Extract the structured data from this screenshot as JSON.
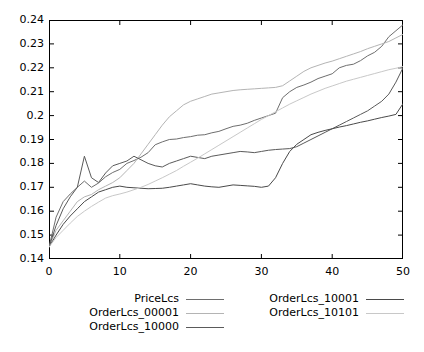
{
  "chart_data": {
    "type": "line",
    "title": "",
    "xlabel": "",
    "ylabel": "",
    "xlim": [
      0,
      50
    ],
    "ylim": [
      0.14,
      0.24
    ],
    "xticks": [
      0,
      10,
      20,
      30,
      40,
      50
    ],
    "xtick_labels": [
      "0",
      "10",
      "20",
      "30",
      "40",
      "50"
    ],
    "yticks": [
      0.14,
      0.15,
      0.16,
      0.17,
      0.18,
      0.19,
      0.2,
      0.21,
      0.22,
      0.23,
      0.24
    ],
    "ytick_labels": [
      "0.14",
      "0.15",
      "0.16",
      "0.17",
      "0.18",
      "0.19",
      "0.2",
      "0.21",
      "0.22",
      "0.23",
      "0.24"
    ],
    "grid": false,
    "legend_position": "below-center",
    "legend_columns": 2,
    "border_color": "#000000",
    "background": "#ffffff",
    "x": [
      0,
      1,
      2,
      3,
      4,
      5,
      6,
      7,
      8,
      9,
      10,
      11,
      12,
      13,
      14,
      15,
      16,
      17,
      18,
      19,
      20,
      21,
      22,
      23,
      24,
      25,
      26,
      27,
      28,
      29,
      30,
      31,
      32,
      33,
      34,
      35,
      36,
      37,
      38,
      39,
      40,
      41,
      42,
      43,
      44,
      45,
      46,
      47,
      48,
      49,
      50
    ],
    "series": [
      {
        "name": "PriceLcs",
        "color": "#6e6e6e",
        "values": [
          0.145,
          0.1575,
          0.164,
          0.1672,
          0.17,
          0.1726,
          0.17,
          0.1718,
          0.1744,
          0.1762,
          0.1775,
          0.18,
          0.1812,
          0.1826,
          0.1845,
          0.1878,
          0.189,
          0.19,
          0.1902,
          0.1908,
          0.1912,
          0.1918,
          0.192,
          0.1928,
          0.1934,
          0.1945,
          0.1955,
          0.196,
          0.1968,
          0.198,
          0.199,
          0.2,
          0.201,
          0.2075,
          0.21,
          0.2118,
          0.2128,
          0.214,
          0.2155,
          0.2165,
          0.2175,
          0.22,
          0.221,
          0.2215,
          0.223,
          0.225,
          0.2265,
          0.229,
          0.233,
          0.2355,
          0.238
        ]
      },
      {
        "name": "OrderLcs_00001",
        "color": "#b4b4b4",
        "values": [
          0.145,
          0.152,
          0.156,
          0.16,
          0.164,
          0.166,
          0.167,
          0.169,
          0.1705,
          0.172,
          0.174,
          0.177,
          0.18,
          0.184,
          0.188,
          0.192,
          0.196,
          0.1995,
          0.202,
          0.2045,
          0.206,
          0.207,
          0.208,
          0.209,
          0.2095,
          0.21,
          0.2105,
          0.2108,
          0.211,
          0.2112,
          0.2114,
          0.2116,
          0.2118,
          0.2125,
          0.2145,
          0.2165,
          0.2185,
          0.22,
          0.221,
          0.222,
          0.2228,
          0.2238,
          0.2248,
          0.2258,
          0.2268,
          0.228,
          0.229,
          0.23,
          0.231,
          0.2325,
          0.234
        ]
      },
      {
        "name": "OrderLcs_10000",
        "color": "#5a5a5a",
        "values": [
          0.145,
          0.154,
          0.161,
          0.166,
          0.17,
          0.183,
          0.174,
          0.172,
          0.176,
          0.179,
          0.18,
          0.181,
          0.183,
          0.1815,
          0.18,
          0.179,
          0.1785,
          0.18,
          0.181,
          0.182,
          0.183,
          0.1825,
          0.182,
          0.183,
          0.1835,
          0.184,
          0.1845,
          0.185,
          0.1848,
          0.1845,
          0.185,
          0.1855,
          0.1858,
          0.186,
          0.1862,
          0.187,
          0.1885,
          0.19,
          0.1915,
          0.193,
          0.1945,
          0.196,
          0.1975,
          0.199,
          0.2005,
          0.202,
          0.204,
          0.206,
          0.209,
          0.214,
          0.22
        ]
      },
      {
        "name": "OrderLcs_10001",
        "color": "#4a4a4a",
        "values": [
          0.145,
          0.15,
          0.1545,
          0.158,
          0.161,
          0.164,
          0.166,
          0.168,
          0.169,
          0.17,
          0.1705,
          0.17,
          0.1698,
          0.1696,
          0.1694,
          0.1695,
          0.1696,
          0.17,
          0.1705,
          0.171,
          0.1715,
          0.171,
          0.1705,
          0.1702,
          0.17,
          0.1705,
          0.171,
          0.1708,
          0.1706,
          0.1704,
          0.17,
          0.1705,
          0.174,
          0.18,
          0.185,
          0.188,
          0.19,
          0.192,
          0.193,
          0.1938,
          0.1945,
          0.1952,
          0.1958,
          0.1965,
          0.1972,
          0.1978,
          0.1985,
          0.1992,
          0.1998,
          0.2005,
          0.205
        ]
      },
      {
        "name": "OrderLcs_10101",
        "color": "#c8c8c8",
        "values": [
          0.145,
          0.149,
          0.152,
          0.155,
          0.1578,
          0.16,
          0.162,
          0.1638,
          0.1655,
          0.1665,
          0.1672,
          0.168,
          0.169,
          0.17,
          0.1712,
          0.1726,
          0.174,
          0.1755,
          0.177,
          0.1788,
          0.1805,
          0.1822,
          0.184,
          0.1858,
          0.1876,
          0.1894,
          0.1912,
          0.193,
          0.1948,
          0.1966,
          0.1984,
          0.2,
          0.2016,
          0.2032,
          0.2048,
          0.2062,
          0.2076,
          0.209,
          0.2102,
          0.2114,
          0.2124,
          0.2134,
          0.2144,
          0.2152,
          0.216,
          0.2168,
          0.2176,
          0.2184,
          0.2192,
          0.2198,
          0.2205
        ]
      }
    ]
  },
  "legend": {
    "entries": [
      {
        "label": "PriceLcs",
        "color": "#6e6e6e",
        "col": 0,
        "row": 0
      },
      {
        "label": "OrderLcs_00001",
        "color": "#b4b4b4",
        "col": 0,
        "row": 1
      },
      {
        "label": "OrderLcs_10000",
        "color": "#5a5a5a",
        "col": 0,
        "row": 2
      },
      {
        "label": "OrderLcs_10001",
        "color": "#4a4a4a",
        "col": 1,
        "row": 0
      },
      {
        "label": "OrderLcs_10101",
        "color": "#c8c8c8",
        "col": 1,
        "row": 1
      }
    ]
  }
}
